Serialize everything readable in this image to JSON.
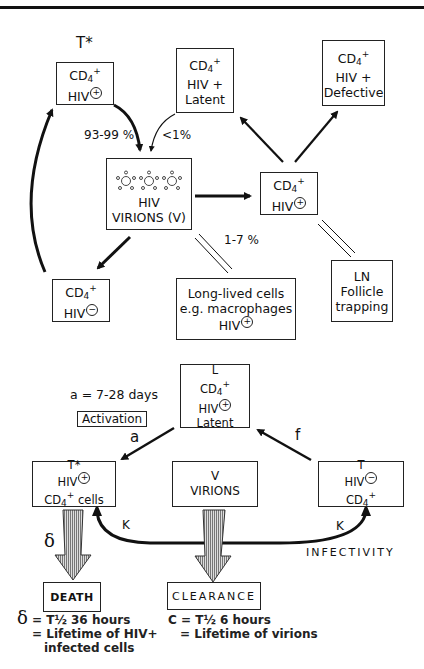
{
  "top_diagram": {
    "t_star_label": "T*",
    "box_infected_top": {
      "l1_base": "CD",
      "l1_sub": "4",
      "l1_sup": "+",
      "l2": "HIV",
      "l2_sign": "+"
    },
    "box_latent": {
      "l1_base": "CD",
      "l1_sub": "4",
      "l1_sup": "+",
      "l2": "HIV +",
      "l3": "Latent"
    },
    "box_defective": {
      "l1_base": "CD",
      "l1_sub": "4",
      "l1_sup": "+",
      "l2": "HIV +",
      "l3": "Defective"
    },
    "box_virions": {
      "l1": "HIV",
      "l2": "VIRIONS (V)"
    },
    "box_infected_right": {
      "l1_base": "CD",
      "l1_sub": "4",
      "l1_sup": "+",
      "l2": "HIV",
      "l2_sign": "+"
    },
    "box_uninfected": {
      "l1_base": "CD",
      "l1_sub": "4",
      "l1_sup": "+",
      "l2": "HIV",
      "l2_sign": "−"
    },
    "box_long_lived": {
      "l1": "Long-lived cells",
      "l2": "e.g. macrophages",
      "l3": "HIV",
      "l3_sign": "+"
    },
    "box_ln": {
      "l1": "LN",
      "l2": "Follicle",
      "l3": "trapping"
    },
    "pct_main": "93-99 %",
    "pct_latent": "<1%",
    "pct_long_lived": "1-7 %"
  },
  "bottom_diagram": {
    "a_days": "a = 7-28 days",
    "activation": "Activation",
    "a_label": "a",
    "f_label": "f",
    "box_latent": {
      "l0": "L",
      "l1_base": "CD",
      "l1_sub": "4",
      "l1_sup": "+",
      "l2": "HIV",
      "l2_sign": "+",
      "l3": "Latent"
    },
    "box_infected": {
      "l0": "T*",
      "l1": "HIV",
      "l1_sign": "+",
      "l2_base": "CD",
      "l2_sub": "4",
      "l2_sup": "+",
      "l2_rest": " cells"
    },
    "box_virions": {
      "l0": "V",
      "l1": "VIRIONS"
    },
    "box_uninfected": {
      "l0": "T",
      "l1": "HIV",
      "l1_sign": "−",
      "l2_base": "CD",
      "l2_sub": "4",
      "l2_sup": "+"
    },
    "k_left": "K",
    "k_right": "K",
    "infectivity": "INFECTIVITY",
    "delta": "δ",
    "death": "DEATH",
    "clearance": "CLEARANCE",
    "death_note": {
      "sym": "δ",
      "l1": "= T½  36 hours",
      "l2": "= Lifetime of  HIV+",
      "l3": "infected  cells"
    },
    "clearance_note": {
      "l1": "C = T½  6 hours",
      "l2": "= Lifetime of  virions"
    }
  }
}
